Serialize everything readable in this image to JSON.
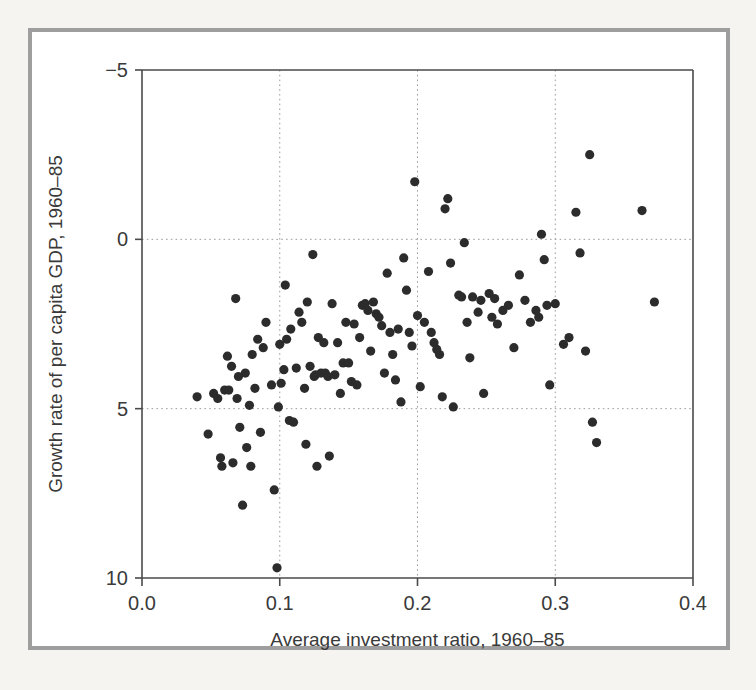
{
  "figure": {
    "kind": "scatter-plot",
    "background": "#f6f4f1",
    "panel_background": "#ffffff",
    "frame_color": "#9e9e9e",
    "point_color": "#2c2c2c",
    "grid_color": "#9c9c9c",
    "axis_color": "#4a4a4a"
  },
  "axes": {
    "x_title": "Average investment ratio, 1960–85",
    "y_title": "Growth rate of per capita GDP, 1960–85",
    "x_ticks": [
      "0.0",
      "0.1",
      "0.2",
      "0.3",
      "0.4"
    ],
    "y_ticks": [
      "10",
      "5",
      "0",
      "-5"
    ]
  },
  "chart_data": {
    "type": "scatter",
    "title": "",
    "subtitle": "",
    "xlabel": "Average investment ratio, 1960–85",
    "ylabel": "Growth rate of per capita GDP, 1960–85",
    "xlim": [
      0.0,
      0.4
    ],
    "ylim": [
      -5,
      10
    ],
    "xticks": [
      0.0,
      0.1,
      0.2,
      0.3,
      0.4
    ],
    "yticks": [
      -5,
      0,
      5,
      10
    ],
    "grid": true,
    "grid_style": "dotted",
    "legend": "none",
    "marker": "filled-circle",
    "marker_size_px": 9,
    "n_points": 118,
    "points": [
      [
        0.04,
        0.35
      ],
      [
        0.048,
        -0.75
      ],
      [
        0.052,
        0.45
      ],
      [
        0.055,
        0.3
      ],
      [
        0.057,
        -1.45
      ],
      [
        0.058,
        -1.7
      ],
      [
        0.06,
        0.55
      ],
      [
        0.062,
        1.55
      ],
      [
        0.063,
        0.55
      ],
      [
        0.065,
        1.25
      ],
      [
        0.066,
        -1.6
      ],
      [
        0.068,
        3.25
      ],
      [
        0.069,
        0.3
      ],
      [
        0.07,
        0.95
      ],
      [
        0.071,
        -0.55
      ],
      [
        0.073,
        -2.85
      ],
      [
        0.075,
        1.05
      ],
      [
        0.076,
        -1.15
      ],
      [
        0.078,
        0.1
      ],
      [
        0.079,
        -1.7
      ],
      [
        0.08,
        1.6
      ],
      [
        0.082,
        0.6
      ],
      [
        0.084,
        2.05
      ],
      [
        0.086,
        -0.7
      ],
      [
        0.088,
        1.8
      ],
      [
        0.09,
        2.55
      ],
      [
        0.094,
        0.7
      ],
      [
        0.096,
        -2.4
      ],
      [
        0.098,
        -4.7
      ],
      [
        0.099,
        0.05
      ],
      [
        0.1,
        1.9
      ],
      [
        0.101,
        0.75
      ],
      [
        0.103,
        1.15
      ],
      [
        0.104,
        3.65
      ],
      [
        0.105,
        2.05
      ],
      [
        0.107,
        -0.35
      ],
      [
        0.108,
        2.35
      ],
      [
        0.11,
        -0.4
      ],
      [
        0.112,
        1.2
      ],
      [
        0.114,
        2.85
      ],
      [
        0.116,
        2.55
      ],
      [
        0.118,
        0.6
      ],
      [
        0.119,
        -1.05
      ],
      [
        0.12,
        3.15
      ],
      [
        0.122,
        1.25
      ],
      [
        0.124,
        4.55
      ],
      [
        0.125,
        0.95
      ],
      [
        0.126,
        1.0
      ],
      [
        0.127,
        -1.7
      ],
      [
        0.128,
        2.1
      ],
      [
        0.13,
        1.05
      ],
      [
        0.132,
        1.95
      ],
      [
        0.133,
        1.05
      ],
      [
        0.135,
        0.95
      ],
      [
        0.136,
        -1.4
      ],
      [
        0.138,
        3.1
      ],
      [
        0.14,
        1.0
      ],
      [
        0.142,
        1.95
      ],
      [
        0.144,
        0.45
      ],
      [
        0.146,
        1.35
      ],
      [
        0.148,
        2.55
      ],
      [
        0.15,
        1.35
      ],
      [
        0.152,
        0.8
      ],
      [
        0.154,
        2.5
      ],
      [
        0.156,
        0.7
      ],
      [
        0.158,
        2.1
      ],
      [
        0.16,
        3.05
      ],
      [
        0.162,
        3.1
      ],
      [
        0.164,
        2.9
      ],
      [
        0.166,
        1.7
      ],
      [
        0.168,
        3.15
      ],
      [
        0.17,
        2.8
      ],
      [
        0.172,
        2.7
      ],
      [
        0.174,
        2.45
      ],
      [
        0.176,
        1.05
      ],
      [
        0.178,
        4.0
      ],
      [
        0.18,
        2.25
      ],
      [
        0.182,
        1.6
      ],
      [
        0.184,
        0.85
      ],
      [
        0.186,
        2.35
      ],
      [
        0.188,
        0.2
      ],
      [
        0.19,
        4.45
      ],
      [
        0.192,
        3.5
      ],
      [
        0.194,
        2.25
      ],
      [
        0.196,
        1.85
      ],
      [
        0.198,
        6.7
      ],
      [
        0.2,
        2.75
      ],
      [
        0.202,
        0.65
      ],
      [
        0.205,
        2.55
      ],
      [
        0.208,
        4.05
      ],
      [
        0.21,
        2.25
      ],
      [
        0.212,
        1.95
      ],
      [
        0.214,
        1.75
      ],
      [
        0.216,
        1.6
      ],
      [
        0.218,
        0.35
      ],
      [
        0.22,
        5.9
      ],
      [
        0.222,
        6.2
      ],
      [
        0.224,
        4.3
      ],
      [
        0.226,
        0.05
      ],
      [
        0.23,
        3.35
      ],
      [
        0.232,
        3.3
      ],
      [
        0.234,
        4.9
      ],
      [
        0.236,
        2.55
      ],
      [
        0.238,
        1.5
      ],
      [
        0.24,
        3.3
      ],
      [
        0.244,
        2.85
      ],
      [
        0.246,
        3.2
      ],
      [
        0.248,
        0.45
      ],
      [
        0.252,
        3.4
      ],
      [
        0.254,
        2.7
      ],
      [
        0.256,
        3.25
      ],
      [
        0.258,
        2.5
      ],
      [
        0.262,
        2.9
      ],
      [
        0.266,
        3.05
      ],
      [
        0.27,
        1.8
      ],
      [
        0.274,
        3.95
      ],
      [
        0.278,
        3.2
      ],
      [
        0.282,
        2.55
      ],
      [
        0.286,
        2.9
      ],
      [
        0.288,
        2.7
      ],
      [
        0.29,
        5.15
      ],
      [
        0.292,
        4.4
      ],
      [
        0.294,
        3.05
      ],
      [
        0.296,
        0.7
      ],
      [
        0.3,
        3.1
      ],
      [
        0.306,
        1.9
      ],
      [
        0.31,
        2.1
      ],
      [
        0.315,
        5.8
      ],
      [
        0.318,
        4.6
      ],
      [
        0.322,
        1.7
      ],
      [
        0.325,
        7.5
      ],
      [
        0.327,
        -0.4
      ],
      [
        0.33,
        -1.0
      ],
      [
        0.363,
        5.85
      ],
      [
        0.372,
        3.15
      ]
    ]
  }
}
